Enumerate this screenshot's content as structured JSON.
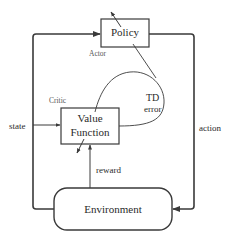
{
  "diagram": {
    "nodes": {
      "policy": {
        "label": "Policy",
        "role_label": "Actor"
      },
      "value_function": {
        "label_line1": "Value",
        "label_line2": "Function",
        "role_label": "Critic"
      },
      "environment": {
        "label": "Environment"
      }
    },
    "edges": {
      "state": "state",
      "action": "action",
      "reward": "reward",
      "td_error_line1": "TD",
      "td_error_line2": "error"
    },
    "colors": {
      "stroke": "#3a3a3a",
      "background": "#ffffff",
      "text": "#2a2a2a"
    }
  }
}
